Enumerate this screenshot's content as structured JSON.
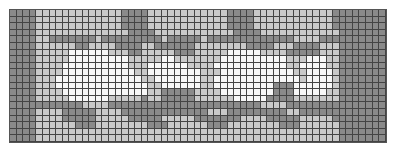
{
  "chart": {
    "title": "",
    "columns": 57,
    "rows": 20,
    "palette": {
      "0": "#f7f7f7",
      "1": "#c9c9c9",
      "2": "#8a8a8a"
    },
    "legend": {
      "0": "white",
      "1": "light gray",
      "2": "dark gray"
    },
    "cells": [
      "222211111111111112222111111111111222211111111111122222222",
      "222211111111111112222111111111111222211111111111122222222",
      "222211111111111112222111111111111222211111111111122222222",
      "222211111111111111222211111111111122221111111111112222222",
      "222211222222212222222221222221222222222222211112222222222",
      "222211111122111122221122222211111111222211122221112222222",
      "222211111000000111221111122211111000001111222221112222222",
      "222211111000000000111110011111110000000000111000112222222",
      "222211110000000000111000000111100000000000110000112222222",
      "222211110000000000011000000001110000000000011000012222222",
      "222211100000000000001100000001100000000000001000012222222",
      "222211100000000000000110000001100000000022200000012222222",
      "222211110000000000000112222211110000000022200000112222222",
      "222211111000000111112112222211111100000222211111112222222",
      "222222222221111222222222222222222222221111222222222222222",
      "222211112222211112222222222222111222222222112222222222222",
      "222211112222211111222221111122222221111222221111122222222",
      "222211111122211111111222111111222111111112221111112222222",
      "222211111111111111111111111111111111111111111111112222222",
      "222211111111111111111111111111111111111111111111112222222"
    ]
  }
}
